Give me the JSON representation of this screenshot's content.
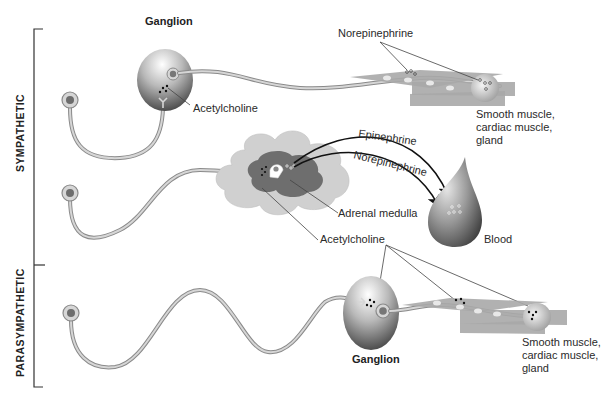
{
  "divisions": {
    "sympathetic": "SYMPATHETIC",
    "parasympathetic": "PARASYMPATHETIC"
  },
  "sympathetic_pathway": {
    "ganglion_label": "Ganglion",
    "neurotransmitter_ganglion": "Acetylcholine",
    "neurotransmitter_effector": "Norepinephrine",
    "effector_line1": "Smooth muscle,",
    "effector_line2": "cardiac muscle,",
    "effector_line3": "gland"
  },
  "adrenal_pathway": {
    "hormone_1": "Epinephrine",
    "hormone_2": "Norepinephrine",
    "organ_label": "Adrenal medulla",
    "target_label": "Blood"
  },
  "shared": {
    "acetylcholine_label": "Acetylcholine"
  },
  "parasympathetic_pathway": {
    "ganglion_label": "Ganglion",
    "effector_line1": "Smooth muscle,",
    "effector_line2": "cardiac muscle,",
    "effector_line3": "gland"
  },
  "colors": {
    "ganglion_dark": "#4a4a4a",
    "ganglion_light": "#f2f2f2",
    "axon_outline": "#8a8a8a",
    "axon_fill": "#d6d6d6",
    "adrenal_outer": "#d0d0d0",
    "adrenal_inner": "#6e6e6e",
    "muscle": "#a9a9a9"
  }
}
